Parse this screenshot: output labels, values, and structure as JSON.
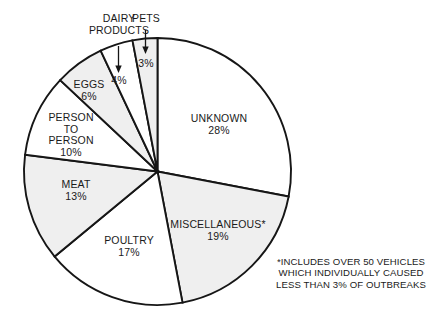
{
  "chart_data": {
    "type": "pie",
    "title": "",
    "subtitle": "",
    "xlabel": "",
    "ylabel": "",
    "legend_position": "none",
    "grid": false,
    "value_unit": "percent",
    "start_angle_deg": 0,
    "direction": "clockwise",
    "categories": [
      "UNKNOWN",
      "MISCELLANEOUS*",
      "POULTRY",
      "MEAT",
      "PERSON TO PERSON",
      "EGGS",
      "DAIRY PRODUCTS",
      "PETS"
    ],
    "values": [
      28,
      19,
      17,
      13,
      10,
      6,
      4,
      3
    ],
    "slices": [
      {
        "name": "UNKNOWN",
        "label_lines": [
          "UNKNOWN"
        ],
        "value": 28,
        "percent_text": "28%",
        "fill": "#ffffff",
        "label_style": "inside"
      },
      {
        "name": "MISCELLANEOUS*",
        "label_lines": [
          "MISCELLANEOUS*"
        ],
        "value": 19,
        "percent_text": "19%",
        "fill": "#efefef",
        "label_style": "inside"
      },
      {
        "name": "POULTRY",
        "label_lines": [
          "POULTRY"
        ],
        "value": 17,
        "percent_text": "17%",
        "fill": "#ffffff",
        "label_style": "inside"
      },
      {
        "name": "MEAT",
        "label_lines": [
          "MEAT"
        ],
        "value": 13,
        "percent_text": "13%",
        "fill": "#efefef",
        "label_style": "inside"
      },
      {
        "name": "PERSON TO PERSON",
        "label_lines": [
          "PERSON",
          "TO",
          "PERSON"
        ],
        "value": 10,
        "percent_text": "10%",
        "fill": "#ffffff",
        "label_style": "inside"
      },
      {
        "name": "EGGS",
        "label_lines": [
          "EGGS"
        ],
        "value": 6,
        "percent_text": "6%",
        "fill": "#efefef",
        "label_style": "inside"
      },
      {
        "name": "DAIRY PRODUCTS",
        "label_lines": [
          "DAIRY",
          "PRODUCTS"
        ],
        "value": 4,
        "percent_text": "4%",
        "fill": "#ffffff",
        "label_style": "callout"
      },
      {
        "name": "PETS",
        "label_lines": [
          "PETS"
        ],
        "value": 3,
        "percent_text": "3%",
        "fill": "#efefef",
        "label_style": "callout"
      }
    ],
    "annotations": [
      "*INCLUDES OVER 50 VEHICLES",
      "WHICH INDIVIDUALLY CAUSED",
      "LESS THAN 3% OF OUTBREAKS"
    ]
  },
  "labels": {
    "unknown_name": "UNKNOWN",
    "unknown_pct": "28%",
    "misc_name": "MISCELLANEOUS*",
    "misc_pct": "19%",
    "poultry_name": "POULTRY",
    "poultry_pct": "17%",
    "meat_name": "MEAT",
    "meat_pct": "13%",
    "ptp_line1": "PERSON",
    "ptp_line2": "TO",
    "ptp_line3": "PERSON",
    "ptp_pct": "10%",
    "eggs_name": "EGGS",
    "eggs_pct": "6%",
    "dairy_line1": "DAIRY",
    "dairy_line2": "PRODUCTS",
    "dairy_pct": "4%",
    "pets_name": "PETS",
    "pets_pct": "3%"
  },
  "footnote": {
    "line1": "*INCLUDES OVER 50 VEHICLES",
    "line2": "WHICH INDIVIDUALLY CAUSED",
    "line3": "LESS THAN 3% OF OUTBREAKS"
  },
  "colors": {
    "stroke": "#161616",
    "shaded": "#efefef",
    "white": "#ffffff",
    "text": "#1a1a1a"
  }
}
